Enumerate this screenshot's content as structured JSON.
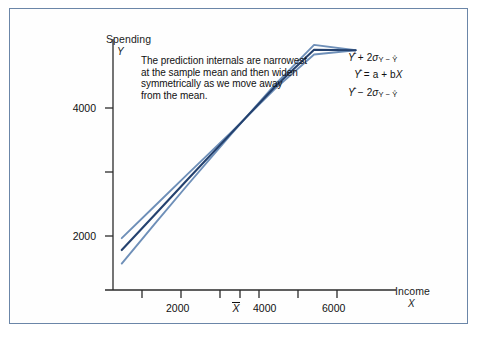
{
  "figure": {
    "border_color": "#6b86a8",
    "background": "#fefefe"
  },
  "annotation": {
    "lines": [
      "The prediction internals are narrowest",
      "at the sample mean and then widen",
      "symmetrically as we move away",
      "from the mean."
    ]
  },
  "legend": {
    "upper": {
      "lead": "Y",
      "op": "+",
      "coef": "2",
      "sigma": "σ",
      "sub": "Y − Ŷ"
    },
    "middle": {
      "lead": "Y",
      "op": "=",
      "rest": "a + b",
      "xvar": "X"
    },
    "lower": {
      "lead": "Y",
      "op": "−",
      "coef": "2",
      "sigma": "σ",
      "sub": "Y − Ŷ"
    }
  },
  "axes": {
    "y_title": "Spending",
    "y_var": "Y",
    "x_title": "Income",
    "x_var": "X",
    "mean_marker": "X"
  },
  "chart_data": {
    "type": "line",
    "title": "",
    "xlabel": "Income",
    "ylabel": "Spending",
    "xlim": [
      800,
      7000
    ],
    "ylim": [
      700,
      5200
    ],
    "grid": false,
    "legend_position": "right-inline",
    "x_ticks": [
      1000,
      2000,
      3000,
      4000,
      5000,
      6000,
      7000
    ],
    "x_tick_labels": [
      "",
      "2000",
      "",
      "4000",
      "",
      "6000",
      ""
    ],
    "y_ticks": [
      2000,
      3000,
      4000
    ],
    "y_tick_labels": [
      "2000",
      "",
      "4000"
    ],
    "x_mean": 3500,
    "series": [
      {
        "name": "Ŷ + 2σY−Ŷ",
        "color": "#6e8fb8",
        "width": 1.9,
        "x": [
          1000,
          1750,
          2500,
          3500,
          4500,
          5400,
          6350
        ],
        "y": [
          1660,
          2250,
          2840,
          3620,
          4420,
          5060,
          5140
        ]
      },
      {
        "name": "Ŷ = a + bX",
        "color": "#24416e",
        "width": 2.1,
        "x": [
          1000,
          1750,
          2500,
          3500,
          4500,
          5400,
          6350
        ],
        "y": [
          1440,
          2090,
          2740,
          3600,
          4460,
          5150,
          5140
        ]
      },
      {
        "name": "Ŷ − 2σY−Ŷ",
        "color": "#6e8fb8",
        "width": 1.9,
        "x": [
          1000,
          1750,
          2500,
          3500,
          4500,
          5400,
          6350
        ],
        "y": [
          1190,
          1920,
          2640,
          3580,
          4500,
          5240,
          5140
        ]
      }
    ]
  }
}
